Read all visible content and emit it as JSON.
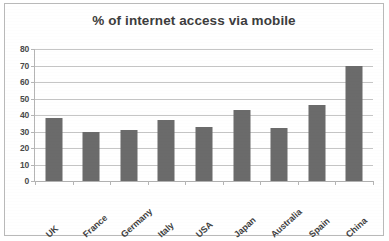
{
  "chart_data": {
    "type": "bar",
    "title": "% of internet access via mobile",
    "xlabel": "",
    "ylabel": "",
    "categories": [
      "UK",
      "France",
      "Germany",
      "Italy",
      "USA",
      "Japan",
      "Australia",
      "Spain",
      "China"
    ],
    "values": [
      38,
      30,
      31,
      37,
      33,
      43,
      32,
      46,
      70
    ],
    "ylim": [
      0,
      80
    ],
    "ytick_step": 10,
    "ytick_labels": [
      "0",
      "10",
      "20",
      "30",
      "40",
      "50",
      "60",
      "70",
      "80"
    ],
    "grid": true,
    "legend": "none",
    "series": [
      {
        "name": "% of internet access via mobile",
        "values": [
          38,
          30,
          31,
          37,
          33,
          43,
          32,
          46,
          70
        ]
      }
    ],
    "colors": {
      "bar": "#6b6b6b",
      "gridline": "#c6c6c6",
      "axis": "#b5b5b5",
      "title_text": "#3d3d3d",
      "tick_text": "#4a4a4a",
      "background": "#ffffff",
      "frame_border": "#b9b9b9"
    }
  }
}
